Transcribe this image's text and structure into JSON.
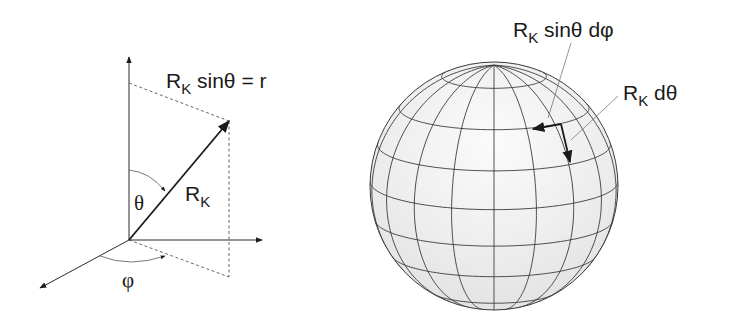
{
  "colors": {
    "ink": "#1a1a1a",
    "dash": "#444444",
    "sphere_fill": "#ececec",
    "sphere_highlight": "#fafafa",
    "grid": "#3a3a3a",
    "leader": "#555555"
  },
  "left_diagram": {
    "origin": [
      129,
      240
    ],
    "z_axis_tip": [
      129,
      57
    ],
    "x_axis_tip": [
      262,
      240
    ],
    "y_axis_tip": [
      40,
      288
    ],
    "vector_tip": [
      229,
      121
    ],
    "projection_top": [
      129,
      83
    ],
    "projection_base": [
      229,
      277
    ],
    "labels": {
      "radius_eq_main": "R",
      "radius_eq_sub": "K",
      "radius_eq_rest": " sinθ = r",
      "vector_main": "R",
      "vector_sub": "K",
      "theta": "θ",
      "phi": "φ"
    }
  },
  "sphere": {
    "center": [
      494,
      186
    ],
    "radius": 124,
    "tilt_deg": 13,
    "latitudes_deg": [
      25,
      50,
      70,
      88,
      106,
      124,
      148
    ],
    "meridians_deg": [
      -80,
      -60,
      -40,
      -20,
      0,
      20,
      40,
      60,
      80
    ],
    "element_corner": [
      561,
      124
    ],
    "arrow_phi_tip": [
      533,
      129
    ],
    "arrow_theta_tip": [
      570,
      162
    ],
    "labels": {
      "dphi_main": "R",
      "dphi_sub": "K",
      "dphi_rest": " sinθ dφ",
      "dtheta_main": "R",
      "dtheta_sub": "K",
      "dtheta_rest": " dθ"
    }
  }
}
